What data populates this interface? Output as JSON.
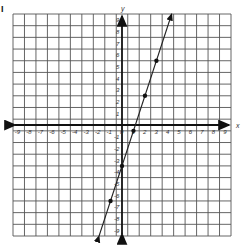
{
  "problem_label": "I",
  "chart_data": {
    "type": "line",
    "title": "",
    "xlabel": "x",
    "ylabel": "y",
    "xlim": [
      -9.5,
      9.5
    ],
    "ylim": [
      -9.5,
      9.5
    ],
    "grid": true,
    "x_ticks": [
      -9,
      -8,
      -7,
      -6,
      -5,
      -4,
      -3,
      -2,
      -1,
      0,
      1,
      2,
      3,
      4,
      5,
      6,
      7,
      8,
      9
    ],
    "y_ticks": [
      -9,
      -8,
      -7,
      -6,
      -5,
      -4,
      -3,
      -2,
      -1,
      1,
      2,
      3,
      4,
      5,
      6,
      7,
      8,
      9
    ],
    "series": [
      {
        "name": "line",
        "equation": "y = 3x - 3.5",
        "slope": 3,
        "intercept": -3.5,
        "points": [
          [
            -1,
            -6.5
          ],
          [
            0,
            -3.5
          ],
          [
            1,
            -0.5
          ],
          [
            2,
            2.5
          ],
          [
            3,
            5.5
          ]
        ],
        "extends": [
          [
            -2,
            -9.5
          ],
          [
            4.33,
            9.5
          ]
        ]
      }
    ],
    "colors": {
      "grid": "#555555",
      "axis": "#111111",
      "line": "#222222"
    }
  }
}
